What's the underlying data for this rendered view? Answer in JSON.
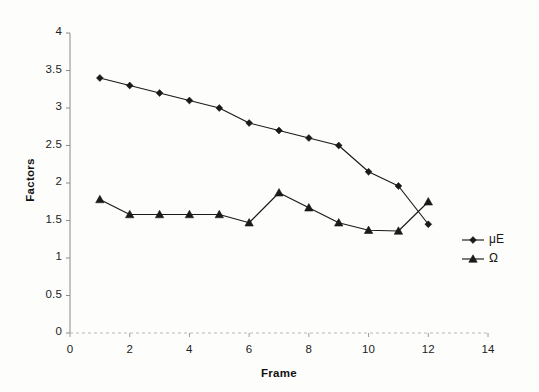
{
  "chart_data": {
    "type": "line",
    "title": "",
    "xlabel": "Frame",
    "ylabel": "Factors",
    "xlim": [
      0,
      14
    ],
    "ylim": [
      0,
      4
    ],
    "xticks": [
      "0",
      "2",
      "4",
      "6",
      "8",
      "10",
      "12",
      "14"
    ],
    "xtick_values": [
      0,
      2,
      4,
      6,
      8,
      10,
      12,
      14
    ],
    "yticks": [
      "0",
      "0.5",
      "1",
      "1.5",
      "2",
      "2.5",
      "3",
      "3.5",
      "4"
    ],
    "ytick_values": [
      0,
      0.5,
      1,
      1.5,
      2,
      2.5,
      3,
      3.5,
      4
    ],
    "grid": false,
    "legend_position": "right",
    "x": [
      1,
      2,
      3,
      4,
      5,
      6,
      7,
      8,
      9,
      10,
      11,
      12
    ],
    "series": [
      {
        "name": "μE",
        "marker": "diamond",
        "color": "#1a1a1a",
        "values": [
          3.4,
          3.3,
          3.2,
          3.1,
          3.0,
          2.8,
          2.7,
          2.6,
          2.5,
          2.15,
          1.96,
          1.45
        ]
      },
      {
        "name": "Ω",
        "marker": "triangle",
        "color": "#1a1a1a",
        "values": [
          1.78,
          1.58,
          1.58,
          1.58,
          1.58,
          1.47,
          1.87,
          1.67,
          1.47,
          1.37,
          1.36,
          1.75
        ]
      }
    ]
  },
  "legend": {
    "entries": [
      {
        "label": "μE",
        "marker": "diamond"
      },
      {
        "label": "Ω",
        "marker": "triangle"
      }
    ]
  },
  "axes": {
    "x_title": "Frame",
    "y_title": "Factors"
  }
}
